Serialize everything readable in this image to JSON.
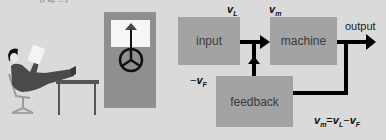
{
  "figure": {
    "caption_cut": "(Fig. ...)",
    "blocks": {
      "input": "input",
      "machine": "machine",
      "feedback": "feedback"
    },
    "labels": {
      "output": "output",
      "vL_base": "v",
      "vL_sub": "L",
      "vm_base": "v",
      "vm_sub": "m",
      "vF_prefix": "−",
      "vF_base": "v",
      "vF_sub": "F",
      "equation": {
        "t1_base": "v",
        "t1_sub": "m",
        "op1": "=",
        "t2_base": "v",
        "t2_sub": "L",
        "op2": "−",
        "t3_base": "v",
        "t3_sub": "F"
      }
    },
    "illustration": {
      "person": "man-reclining-reading",
      "panel": "control-panel-with-wheel-and-arrow"
    },
    "colors": {
      "background": "#dadada",
      "block": "#a3a3a3",
      "panel": "#8f8f8f",
      "line": "#000000"
    }
  }
}
